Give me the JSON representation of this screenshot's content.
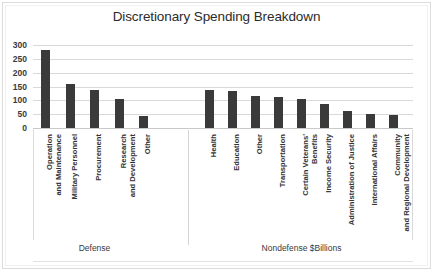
{
  "chart_data": {
    "type": "bar",
    "title": "Discretionary Spending Breakdown",
    "xlabel": "",
    "ylabel": "",
    "ylim": [
      0,
      300
    ],
    "yticks": [
      0,
      50,
      100,
      150,
      200,
      250,
      300
    ],
    "ytick_labels": [
      "0",
      "50",
      "100",
      "150",
      "200",
      "250",
      "300"
    ],
    "grid": true,
    "legend": false,
    "bar_color": "#3a3a3a",
    "units_note": "$Billions",
    "groups": [
      {
        "name": "Defense",
        "label": "Defense",
        "categories": [
          "Operation and Maintenance",
          "Military Personnel",
          "Procurement",
          "Research and Development",
          "Other"
        ],
        "values": [
          283,
          158,
          139,
          105,
          45
        ]
      },
      {
        "name": "Nondefense",
        "label": "Nondefense  $Billions",
        "categories": [
          "Health",
          "Education",
          "Other",
          "Transportation",
          "Certain Veterans' Benefits",
          "Income Security",
          "Administration of Justice",
          "International Affairs",
          "Community and Regional Development"
        ],
        "values": [
          137,
          132,
          116,
          112,
          105,
          85,
          60,
          52,
          48
        ]
      }
    ],
    "categories": [
      "Operation and Maintenance",
      "Military Personnel",
      "Procurement",
      "Research and Development",
      "Other",
      "Health",
      "Education",
      "Other",
      "Transportation",
      "Certain Veterans' Benefits",
      "Income Security",
      "Administration of Justice",
      "International Affairs",
      "Community and Regional Development"
    ],
    "values": [
      283,
      158,
      139,
      105,
      45,
      137,
      132,
      116,
      112,
      105,
      85,
      60,
      52,
      48
    ]
  },
  "axis": {
    "y_tick_0": "0",
    "y_tick_1": "50",
    "y_tick_2": "100",
    "y_tick_3": "150",
    "y_tick_4": "200",
    "y_tick_5": "250",
    "y_tick_6": "300"
  },
  "labels": {
    "defense_group": "Defense",
    "nondefense_group": "Nondefense  $Billions"
  }
}
